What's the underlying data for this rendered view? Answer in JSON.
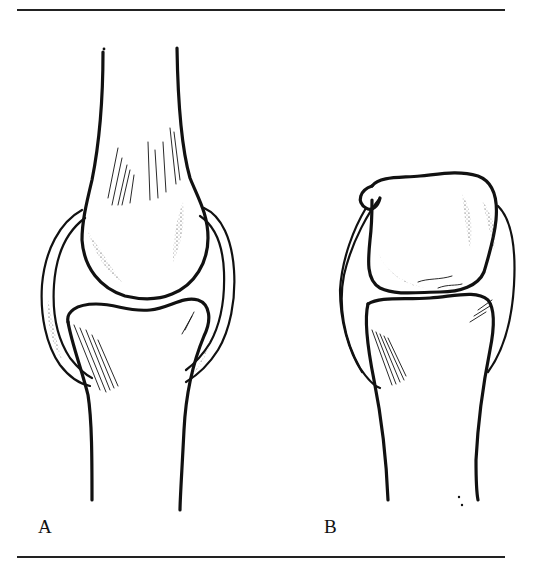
{
  "figure": {
    "panels": [
      {
        "id": "A",
        "label": "A",
        "view": "joint, front view"
      },
      {
        "id": "B",
        "label": "B",
        "view": "joint, side view"
      }
    ],
    "colors": {
      "ink": "#111111",
      "background": "#ffffff"
    }
  }
}
